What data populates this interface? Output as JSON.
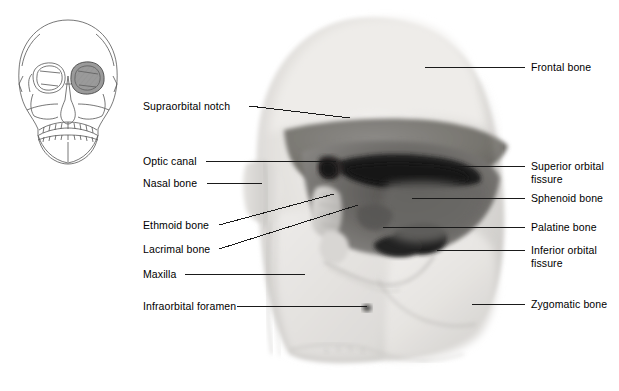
{
  "figure": {
    "view": "anterolateral view of right orbit",
    "background_color": "#ffffff",
    "text_color": "#000000",
    "leader_color": "#1a1a1a"
  },
  "inset": {
    "name": "anterior-skull-orientation-diagram",
    "description": "line drawing of anterior skull with right orbit shaded",
    "shade_color": "#9a9a9a",
    "outline_color": "#4a4a4a"
  },
  "photo": {
    "name": "orbit-bone-photograph",
    "description": "grayscale photograph of right orbit bones",
    "tones": {
      "bone_light": "#eceae7",
      "bone_mid": "#cfcdca",
      "orbit_mid": "#8f8d8a",
      "orbit_dark": "#5d5b59",
      "fissure_black": "#1b1b1b"
    }
  },
  "labels": {
    "left": [
      {
        "text": "Supraorbital notch",
        "x": 143,
        "y": 100,
        "leader_x1": 249,
        "leader_y1": 106,
        "leader_x2": 350,
        "leader_y2": 118
      },
      {
        "text": "Optic canal",
        "x": 143,
        "y": 155,
        "leader_x1": 206,
        "leader_y1": 161,
        "leader_x2": 336,
        "leader_y2": 161
      },
      {
        "text": "Nasal bone",
        "x": 143,
        "y": 177,
        "leader_x1": 207,
        "leader_y1": 183,
        "leader_x2": 262,
        "leader_y2": 183
      },
      {
        "text": "Ethmoid bone",
        "x": 143,
        "y": 219,
        "leader_x1": 219,
        "leader_y1": 225,
        "leader_x2": 334,
        "leader_y2": 194
      },
      {
        "text": "Lacrimal bone",
        "x": 143,
        "y": 243,
        "leader_x1": 219,
        "leader_y1": 249,
        "leader_x2": 358,
        "leader_y2": 205
      },
      {
        "text": "Maxilla",
        "x": 143,
        "y": 268,
        "leader_x1": 185,
        "leader_y1": 274,
        "leader_x2": 305,
        "leader_y2": 274
      },
      {
        "text": "Infraorbital foramen",
        "x": 143,
        "y": 300,
        "leader_x1": 237,
        "leader_y1": 306,
        "leader_x2": 367,
        "leader_y2": 306
      }
    ],
    "right": [
      {
        "text": "Frontal bone",
        "x": 531,
        "y": 61,
        "leader_x1": 425,
        "leader_y1": 67,
        "leader_x2": 525,
        "leader_y2": 67
      },
      {
        "text": "Superior orbital\nfissure",
        "x": 531,
        "y": 160,
        "leader_x1": 410,
        "leader_y1": 166,
        "leader_x2": 525,
        "leader_y2": 166
      },
      {
        "text": "Sphenoid bone",
        "x": 531,
        "y": 192,
        "leader_x1": 412,
        "leader_y1": 198,
        "leader_x2": 525,
        "leader_y2": 198
      },
      {
        "text": "Palatine bone",
        "x": 531,
        "y": 221,
        "leader_x1": 383,
        "leader_y1": 227,
        "leader_x2": 525,
        "leader_y2": 227
      },
      {
        "text": "Inferior orbital\nfissure",
        "x": 531,
        "y": 244,
        "leader_x1": 437,
        "leader_y1": 250,
        "leader_x2": 525,
        "leader_y2": 250
      },
      {
        "text": "Zygomatic bone",
        "x": 531,
        "y": 298,
        "leader_x1": 472,
        "leader_y1": 304,
        "leader_x2": 525,
        "leader_y2": 304
      }
    ]
  }
}
